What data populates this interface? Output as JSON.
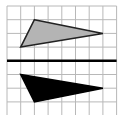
{
  "diagram": {
    "type": "grid-reflection",
    "grid": {
      "cols": 8,
      "rows": 8,
      "cell_px": 13.7,
      "origin_x": 7,
      "origin_y": 6,
      "line_color": "#b8b8b8"
    },
    "axis_line": {
      "row": 4,
      "color": "#000000",
      "width": 2.5
    },
    "shapes": [
      {
        "name": "original-triangle",
        "points": [
          [
            2,
            1
          ],
          [
            7,
            2
          ],
          [
            1,
            3
          ]
        ],
        "fill": "#b4b4b4",
        "stroke": "#222222"
      },
      {
        "name": "reflected-triangle",
        "points": [
          [
            1,
            5
          ],
          [
            7,
            6
          ],
          [
            2,
            7
          ]
        ],
        "fill": "#000000",
        "stroke": "#000000"
      }
    ]
  }
}
